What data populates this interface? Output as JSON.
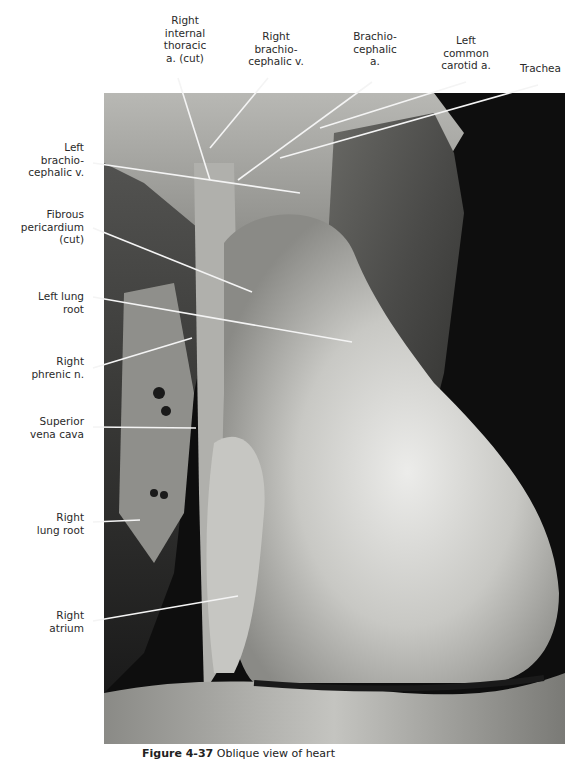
{
  "figure": {
    "caption_label": "Figure 4-37",
    "caption_text": "Oblique view of heart"
  },
  "labels": {
    "top": [
      {
        "id": "right-internal-thoracic",
        "text": "Right\ninternal\nthoracic\na. (cut)"
      },
      {
        "id": "right-brachiocephalic-v",
        "text": "Right\nbrachio-\ncephalic v."
      },
      {
        "id": "brachiocephalic-a",
        "text": "Brachio-\ncephalic\na."
      },
      {
        "id": "left-common-carotid",
        "text": "Left\ncommon\ncarotid a."
      },
      {
        "id": "trachea",
        "text": "Trachea"
      }
    ],
    "left": [
      {
        "id": "left-brachiocephalic-v",
        "text": "Left\nbrachio-\ncephalic v."
      },
      {
        "id": "fibrous-pericardium",
        "text": "Fibrous\npericardium\n(cut)"
      },
      {
        "id": "left-lung-root",
        "text": "Left lung\nroot"
      },
      {
        "id": "right-phrenic-n",
        "text": "Right\nphrenic n."
      },
      {
        "id": "superior-vena-cava",
        "text": "Superior\nvena cava"
      },
      {
        "id": "right-lung-root",
        "text": "Right\nlung root"
      },
      {
        "id": "right-atrium",
        "text": "Right\natrium"
      }
    ]
  },
  "colors": {
    "background": "#ffffff",
    "text": "#2a2a2a",
    "leader": "#f4f4f4",
    "photo_dark": "#0e0e0e",
    "tissue_light": "#d8d8d4",
    "tissue_mid": "#9a9a96"
  }
}
